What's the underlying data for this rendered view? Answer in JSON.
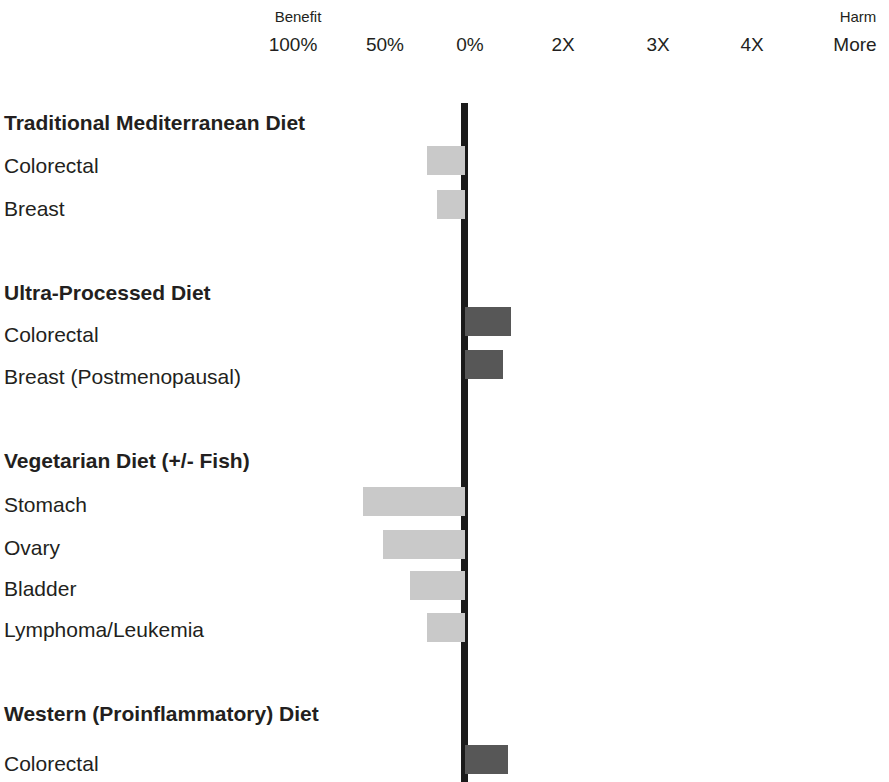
{
  "chart_data": {
    "type": "bar",
    "title": "",
    "subtitle": "",
    "xlabel": "",
    "ylabel": "",
    "orientation": "horizontal",
    "grid": false,
    "legend": null,
    "axis": {
      "left_header": "Benefit",
      "right_header": "Harm",
      "zero_position_px": 465,
      "px_per_tick": 94,
      "tick_labels": [
        "100%",
        "50%",
        "0%",
        "2X",
        "3X",
        "4X",
        "More"
      ],
      "tick_positions_px": [
        293,
        385,
        470,
        563,
        658,
        752,
        855
      ]
    },
    "colors": {
      "benefit_bar": "#c9c9c9",
      "harm_bar": "#575757",
      "axis_line": "#1a1a1a",
      "text": "#231f20",
      "background": "#ffffff"
    },
    "groups": [
      {
        "name": "Traditional Mediterranean Diet",
        "rows": [
          {
            "label": "Colorectal",
            "direction": "benefit",
            "value_pct_reduction": 20,
            "bar_px": {
              "left": 427,
              "right": 465,
              "top": 146
            }
          },
          {
            "label": "Breast",
            "direction": "benefit",
            "value_pct_reduction": 15,
            "bar_px": {
              "left": 437,
              "right": 465,
              "top": 190
            }
          }
        ]
      },
      {
        "name": "Ultra-Processed Diet",
        "rows": [
          {
            "label": "Colorectal",
            "direction": "harm",
            "value_x": 1.5,
            "bar_px": {
              "left": 465,
              "right": 511,
              "top": 307
            }
          },
          {
            "label": "Breast (Postmenopausal)",
            "direction": "harm",
            "value_x": 1.4,
            "bar_px": {
              "left": 465,
              "right": 503,
              "top": 350
            }
          }
        ]
      },
      {
        "name": "Vegetarian Diet (+/- Fish)",
        "rows": [
          {
            "label": "Stomach",
            "direction": "benefit",
            "value_pct_reduction": 55,
            "bar_px": {
              "left": 363,
              "right": 465,
              "top": 487
            }
          },
          {
            "label": "Ovary",
            "direction": "benefit",
            "value_pct_reduction": 44,
            "bar_px": {
              "left": 383,
              "right": 465,
              "top": 530
            }
          },
          {
            "label": "Bladder",
            "direction": "benefit",
            "value_pct_reduction": 30,
            "bar_px": {
              "left": 410,
              "right": 465,
              "top": 571
            }
          },
          {
            "label": "Lymphoma/Leukemia",
            "direction": "benefit",
            "value_pct_reduction": 20,
            "bar_px": {
              "left": 427,
              "right": 465,
              "top": 613
            }
          }
        ]
      },
      {
        "name": "Western (Proinflammatory) Diet",
        "rows": [
          {
            "label": "Colorectal",
            "direction": "harm",
            "value_x": 1.45,
            "bar_px": {
              "left": 465,
              "right": 508,
              "top": 745
            }
          }
        ]
      }
    ],
    "label_rows": [
      {
        "text": "Traditional Mediterranean Diet",
        "kind": "group",
        "y": 112
      },
      {
        "text": "Colorectal",
        "kind": "item",
        "y": 155
      },
      {
        "text": "Breast",
        "kind": "item",
        "y": 198
      },
      {
        "text": "Ultra-Processed Diet",
        "kind": "group",
        "y": 282
      },
      {
        "text": "Colorectal",
        "kind": "item",
        "y": 324
      },
      {
        "text": "Breast (Postmenopausal)",
        "kind": "item",
        "y": 366
      },
      {
        "text": "Vegetarian Diet (+/- Fish)",
        "kind": "group",
        "y": 450
      },
      {
        "text": "Stomach",
        "kind": "item",
        "y": 494
      },
      {
        "text": "Ovary",
        "kind": "item",
        "y": 537
      },
      {
        "text": "Bladder",
        "kind": "item",
        "y": 578
      },
      {
        "text": "Lymphoma/Leukemia",
        "kind": "item",
        "y": 619
      },
      {
        "text": "Western (Proinflammatory) Diet",
        "kind": "group",
        "y": 703
      },
      {
        "text": "Colorectal",
        "kind": "item",
        "y": 753
      }
    ],
    "axis_line_px": {
      "left": 461,
      "top": 103,
      "width": 7,
      "height": 679
    }
  }
}
